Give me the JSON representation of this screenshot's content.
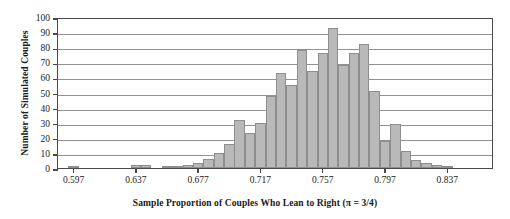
{
  "chart_data": {
    "type": "bar",
    "title": "",
    "xlabel": "Sample Proportion of Couples Who Lean to Right (π = 3/4)",
    "ylabel": "Number of Simulated Couples",
    "ylim": [
      0,
      100
    ],
    "ytick_values": [
      0,
      10,
      20,
      30,
      40,
      50,
      60,
      70,
      80,
      90,
      100
    ],
    "ytick_labels": [
      "0",
      "10",
      "20",
      "30",
      "40",
      "50",
      "60",
      "70",
      "80",
      "90",
      "100"
    ],
    "xlim": [
      0.587,
      0.867
    ],
    "xtick_values": [
      0.597,
      0.637,
      0.677,
      0.717,
      0.757,
      0.797,
      0.837
    ],
    "xtick_labels": [
      "0.597",
      "0.637",
      "0.677",
      "0.717",
      "0.757",
      "0.797",
      "0.837"
    ],
    "grid": "horizontal",
    "legend": "none",
    "bin_width": 0.00667,
    "bin_starts": [
      0.5937,
      0.6003,
      0.607,
      0.6137,
      0.6203,
      0.627,
      0.6337,
      0.6403,
      0.647,
      0.6537,
      0.6603,
      0.667,
      0.6737,
      0.6803,
      0.687,
      0.6937,
      0.7003,
      0.707,
      0.7137,
      0.7203,
      0.727,
      0.7337,
      0.7403,
      0.747,
      0.7537,
      0.7603,
      0.767,
      0.7737,
      0.7803,
      0.787,
      0.7937,
      0.8003,
      0.807,
      0.8137,
      0.8203,
      0.827,
      0.8337,
      0.8403,
      0.847,
      0.8537
    ],
    "categories": [
      "0.594",
      "0.600",
      "0.607",
      "0.614",
      "0.620",
      "0.627",
      "0.634",
      "0.640",
      "0.647",
      "0.654",
      "0.660",
      "0.667",
      "0.674",
      "0.680",
      "0.687",
      "0.694",
      "0.700",
      "0.707",
      "0.714",
      "0.720",
      "0.727",
      "0.734",
      "0.740",
      "0.747",
      "0.754",
      "0.760",
      "0.767",
      "0.774",
      "0.780",
      "0.787",
      "0.794",
      "0.800",
      "0.807",
      "0.814",
      "0.820",
      "0.827",
      "0.834",
      "0.840",
      "0.847",
      "0.854"
    ],
    "values": [
      1,
      0,
      0,
      0,
      0,
      0,
      2,
      2,
      0,
      1,
      1,
      2,
      3,
      6,
      10,
      16,
      32,
      23,
      30,
      48,
      63,
      55,
      78,
      64,
      76,
      93,
      68,
      76,
      82,
      51,
      18,
      29,
      11,
      5,
      3,
      2,
      1,
      0,
      0,
      0
    ],
    "colors": {
      "bar_fill": "#b9b9b9",
      "bar_edge": "#8e8e8e",
      "axis": "#4a4a4a",
      "gridline": "#6e6e6e",
      "background": "#ffffff",
      "text": "#1a1a1a"
    }
  }
}
